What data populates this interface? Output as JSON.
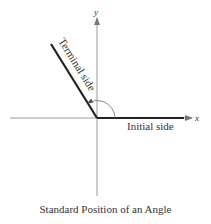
{
  "diagram": {
    "caption": "Standard Position of an Angle",
    "axes": {
      "x_label": "x",
      "y_label": "y"
    },
    "labels": {
      "terminal_side": "Terminal side",
      "initial_side": "Initial side"
    },
    "colors": {
      "axis": "#999999",
      "side": "#222222",
      "arc": "#666666",
      "text": "#333333"
    }
  }
}
